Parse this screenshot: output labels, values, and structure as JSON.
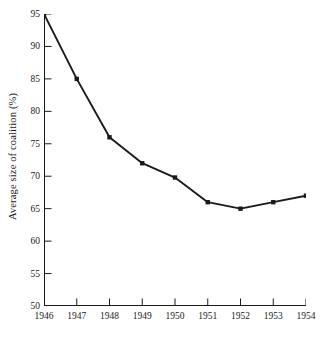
{
  "chart_data": {
    "type": "line",
    "title": "",
    "xlabel": "",
    "ylabel": "Average size of coalition (%)",
    "x": [
      1946,
      1947,
      1948,
      1949,
      1950,
      1951,
      1952,
      1953,
      1954
    ],
    "categories": [
      "1946",
      "1947",
      "1948",
      "1949",
      "1950",
      "1951",
      "1952",
      "1953",
      "1954"
    ],
    "values": [
      95,
      85,
      76,
      72,
      69.8,
      66,
      65,
      66,
      67
    ],
    "series": [
      {
        "name": "Average size of coalition",
        "values": [
          95,
          85,
          76,
          72,
          69.8,
          66,
          65,
          66,
          67
        ]
      }
    ],
    "xlim": [
      1946,
      1954
    ],
    "ylim": [
      50,
      95
    ],
    "ytick_labels": [
      "50",
      "55",
      "60",
      "65",
      "70",
      "75",
      "80",
      "85",
      "90",
      "95"
    ],
    "ytick_values": [
      50,
      55,
      60,
      65,
      70,
      75,
      80,
      85,
      90,
      95
    ],
    "xtick_labels": [
      "1946",
      "1947",
      "1948",
      "1949",
      "1950",
      "1951",
      "1952",
      "1953",
      "1954"
    ],
    "grid": false,
    "legend": "none",
    "marker": "filled-square",
    "line_color": "#1a1a1a",
    "marker_color": "#1a1a1a",
    "background_color": "#ffffff",
    "annotations": []
  }
}
